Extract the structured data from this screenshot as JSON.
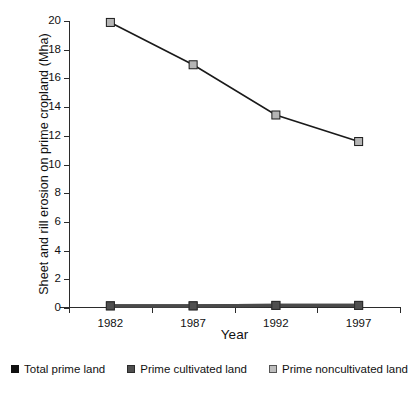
{
  "chart_data": {
    "type": "line",
    "title": "",
    "xlabel": "Year",
    "ylabel": "Sheet and rill erosion on prime cropland (Mha)",
    "categories": [
      "1982",
      "1987",
      "1992",
      "1997"
    ],
    "ylim": [
      0,
      20
    ],
    "yticks": [
      0,
      2,
      4,
      6,
      8,
      10,
      12,
      14,
      16,
      18,
      20
    ],
    "ytick_labels": [
      "0",
      "2",
      "4",
      "6",
      "8",
      "10",
      "12",
      "14",
      "16",
      "18",
      "20"
    ],
    "grid": false,
    "legend_position": "bottom",
    "series": [
      {
        "name": "Total prime land",
        "values": [
          0.15,
          0.15,
          0.18,
          0.18
        ],
        "marker_color": "#111111",
        "line_color": "#4a4a4a"
      },
      {
        "name": "Prime cultivated land",
        "values": [
          0.15,
          0.15,
          0.18,
          0.18
        ],
        "marker_color": "#4f4f4f",
        "line_color": "#4a4a4a"
      },
      {
        "name": "Prime noncultivated land",
        "values": [
          19.9,
          16.95,
          13.45,
          11.6
        ],
        "marker_color": "#b5b5b5",
        "line_color": "#1a1a1a"
      }
    ]
  },
  "legend": {
    "items": [
      {
        "label": "Total prime land",
        "color": "#111111",
        "border": "#111111"
      },
      {
        "label": "Prime cultivated land",
        "color": "#4f4f4f",
        "border": "#2b2b2b"
      },
      {
        "label": "Prime noncultivated land",
        "color": "#bdbdbd",
        "border": "#555555"
      }
    ]
  },
  "axis": {
    "ylabel": "Sheet and rill erosion on prime cropland (Mha)",
    "xlabel": "Year"
  }
}
